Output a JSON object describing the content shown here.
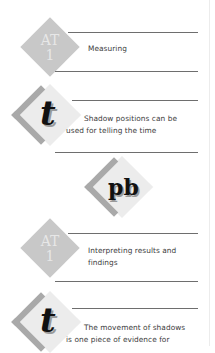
{
  "sections": [
    {
      "type": "attainment-target",
      "badge": {
        "line1": "AT",
        "line2": "1"
      },
      "text_lines": [
        "Measuring"
      ]
    },
    {
      "type": "teaching-point",
      "badge": {
        "glyph": "t"
      },
      "text_lines": [
        "Shadow positions can be",
        "used for telling the time"
      ]
    },
    {
      "type": "pupil-book",
      "badge": {
        "glyph": "pb"
      }
    },
    {
      "type": "attainment-target",
      "badge": {
        "line1": "AT",
        "line2": "1"
      },
      "text_lines": [
        "Interpreting results and",
        "findings"
      ]
    },
    {
      "type": "teaching-point",
      "badge": {
        "glyph": "t"
      },
      "text_lines": [
        "The movement of shadows",
        "is one piece of evidence for"
      ]
    }
  ],
  "colors": {
    "at_badge": "#c8c8c8",
    "badge_chevron": "#a9a9a9",
    "badge_fill": "#ececec",
    "rule": "#6e6e6e"
  }
}
